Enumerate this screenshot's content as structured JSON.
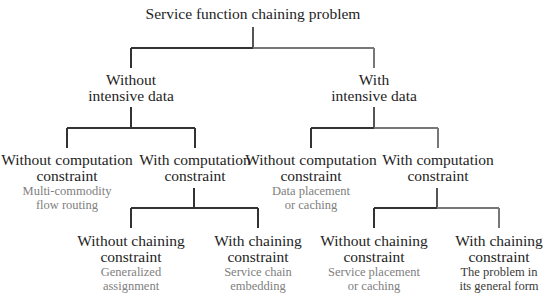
{
  "root": {
    "label": "Service function chaining problem"
  },
  "level1": [
    {
      "line1": "Without",
      "line2": "intensive data"
    },
    {
      "line1": "With",
      "line2": "intensive data"
    }
  ],
  "level2": [
    {
      "line1": "Without computation",
      "line2": "constraint",
      "desc1": "Multi-commodity",
      "desc2": "flow routing"
    },
    {
      "line1": "With computation",
      "line2": "constraint"
    },
    {
      "line1": "Without computation",
      "line2": "constraint",
      "desc1": "Data placement",
      "desc2": "or caching"
    },
    {
      "line1": "With computation",
      "line2": "constraint"
    }
  ],
  "level3": [
    {
      "line1": "Without chaining",
      "line2": "constraint",
      "desc1": "Generalized",
      "desc2": "assignment"
    },
    {
      "line1": "With chaining",
      "line2": "constraint",
      "desc1": "Service chain",
      "desc2": "embedding"
    },
    {
      "line1": "Without chaining",
      "line2": "constraint",
      "desc1": "Service placement",
      "desc2": "or caching"
    },
    {
      "line1": "With chaining",
      "line2": "constraint",
      "desc1": "The problem in",
      "desc2": "its general form"
    }
  ],
  "colors": {
    "line": "#333333",
    "line_light": "#6a6a6a",
    "label": "#1e1e1e",
    "desc": "#808080",
    "desc_emphasis": "#3a3a3a"
  }
}
